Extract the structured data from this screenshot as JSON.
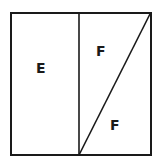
{
  "diagram": {
    "regions": [
      {
        "id": "left",
        "label": "E"
      },
      {
        "id": "right-upper-triangle",
        "label": "F"
      },
      {
        "id": "right-lower-triangle",
        "label": "F"
      }
    ],
    "stroke_color": "#1a1a1a"
  }
}
